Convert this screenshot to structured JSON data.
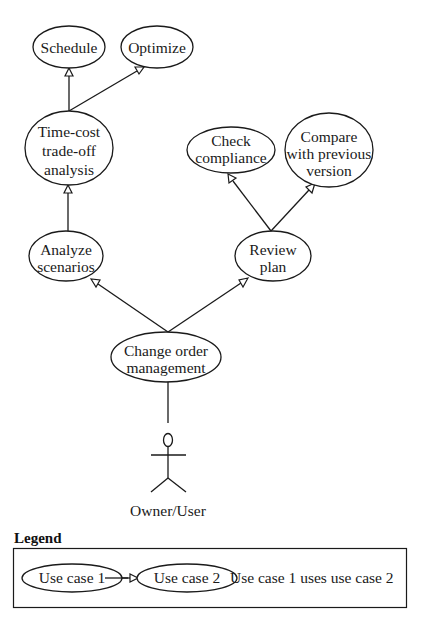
{
  "diagram": {
    "type": "use-case",
    "actor": {
      "id": "owner",
      "label": "Owner/User"
    },
    "nodes": [
      {
        "id": "schedule",
        "lines": [
          "Schedule"
        ],
        "cx": 69,
        "cy": 47,
        "rx": 36,
        "ry": 21
      },
      {
        "id": "optimize",
        "lines": [
          "Optimize"
        ],
        "cx": 157,
        "cy": 47,
        "rx": 36,
        "ry": 21
      },
      {
        "id": "timecost",
        "lines": [
          "Time-cost",
          "trade-off",
          "analysis"
        ],
        "cx": 69,
        "cy": 148,
        "rx": 44,
        "ry": 37
      },
      {
        "id": "compliance",
        "lines": [
          "Check",
          "compliance"
        ],
        "cx": 231,
        "cy": 150,
        "rx": 44,
        "ry": 23
      },
      {
        "id": "compare",
        "lines": [
          "Compare",
          "with previous",
          "version"
        ],
        "cx": 329,
        "cy": 150,
        "rx": 44,
        "ry": 37
      },
      {
        "id": "analyze",
        "lines": [
          "Analyze",
          "scenarios"
        ],
        "cx": 66,
        "cy": 256,
        "rx": 37,
        "ry": 25
      },
      {
        "id": "review",
        "lines": [
          "Review",
          "plan"
        ],
        "cx": 273,
        "cy": 256,
        "rx": 38,
        "ry": 25
      },
      {
        "id": "changeorder",
        "lines": [
          "Change order",
          "management"
        ],
        "cx": 166,
        "cy": 357,
        "rx": 55,
        "ry": 25
      }
    ],
    "edges": [
      {
        "from": "timecost",
        "to": "schedule",
        "relation": "uses"
      },
      {
        "from": "timecost",
        "to": "optimize",
        "relation": "uses"
      },
      {
        "from": "analyze",
        "to": "timecost",
        "relation": "uses"
      },
      {
        "from": "review",
        "to": "compliance",
        "relation": "uses"
      },
      {
        "from": "review",
        "to": "compare",
        "relation": "uses"
      },
      {
        "from": "changeorder",
        "to": "analyze",
        "relation": "uses"
      },
      {
        "from": "changeorder",
        "to": "review",
        "relation": "uses"
      },
      {
        "from": "owner",
        "to": "changeorder",
        "relation": "association"
      }
    ]
  },
  "labels": {
    "schedule": [
      "Schedule"
    ],
    "optimize": [
      "Optimize"
    ],
    "timecost": [
      "Time-cost",
      "trade-off",
      "analysis"
    ],
    "compliance": [
      "Check",
      "compliance"
    ],
    "compare": [
      "Compare",
      "with previous",
      "version"
    ],
    "analyze": [
      "Analyze",
      "scenarios"
    ],
    "review": [
      "Review",
      "plan"
    ],
    "changeorder": [
      "Change order",
      "management"
    ],
    "actor": "Owner/User"
  },
  "legend": {
    "title": "Legend",
    "use_case_1": "Use case 1",
    "use_case_2": "Use case 2",
    "description": "Use case 1 uses use case 2"
  }
}
